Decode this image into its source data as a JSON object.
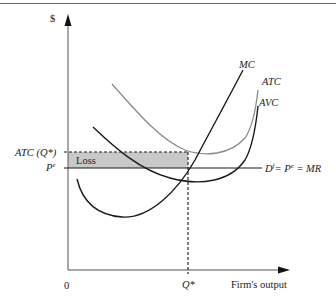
{
  "diagram": {
    "title": "",
    "y_axis_label": "$",
    "x_axis_label": "Firm's output",
    "origin_label": "0",
    "q_star_label": "Q*",
    "atc_q_label": "ATC (Q*)",
    "pe_label_main": "P",
    "pe_label_sup": "e",
    "loss_label": "Loss",
    "demand_label": {
      "d": "D",
      "d_sup": "f",
      "rest1": "= P",
      "p_sup": "e",
      "rest2": " = MR"
    },
    "curves": [
      {
        "name": "MC",
        "label": "MC",
        "color": "#1a1a1a"
      },
      {
        "name": "ATC",
        "label": "ATC",
        "color": "#8c8c8c"
      },
      {
        "name": "AVC",
        "label": "AVC",
        "color": "#1a1a1a"
      }
    ],
    "colors": {
      "loss_fill": "#c8c8c8",
      "axis": "#444444",
      "dashed": "#1a1a1a"
    }
  }
}
